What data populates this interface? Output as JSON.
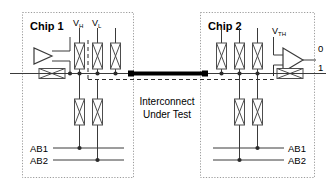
{
  "diagram": {
    "colors": {
      "line": "#3a3a3a",
      "bus": "#000000",
      "box_border": "#9a9a9a",
      "component_fill": "#ffffff",
      "component_stroke": "#555555",
      "text": "#000000"
    },
    "chip1": {
      "label": "Chip 1",
      "driver_icon": "driver-triangle-icon",
      "rail_labels": [
        "V",
        "V"
      ],
      "rail_subscripts": [
        "H",
        "L"
      ],
      "ab_labels": [
        "AB1",
        "AB2"
      ],
      "switch_count_top": 3,
      "switch_count_bottom": 2
    },
    "chip2": {
      "label": "Chip 2",
      "comparator_icon": "comparator-triangle-icon",
      "threshold_label": "V",
      "threshold_subscript": "TH",
      "output_labels": [
        "0",
        "1"
      ],
      "ab_labels": [
        "AB1",
        "AB2"
      ],
      "switch_count_top": 3,
      "switch_count_bottom": 2
    },
    "interconnect": {
      "line1": "Interconnect",
      "line2": "Under Test"
    }
  }
}
